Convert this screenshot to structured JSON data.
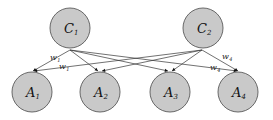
{
  "diagram": {
    "type": "bipartite-graph",
    "top_nodes": [
      {
        "id": "C1",
        "letter": "C",
        "sub": "1",
        "cx": 70,
        "cy": 28,
        "r": 20
      },
      {
        "id": "C2",
        "letter": "C",
        "sub": "2",
        "cx": 203,
        "cy": 28,
        "r": 20
      }
    ],
    "bottom_nodes": [
      {
        "id": "A1",
        "letter": "A",
        "sub": "1",
        "cx": 32,
        "cy": 92,
        "r": 20
      },
      {
        "id": "A2",
        "letter": "A",
        "sub": "2",
        "cx": 100,
        "cy": 92,
        "r": 20
      },
      {
        "id": "A3",
        "letter": "A",
        "sub": "3",
        "cx": 170,
        "cy": 92,
        "r": 20
      },
      {
        "id": "A4",
        "letter": "A",
        "sub": "4",
        "cx": 238,
        "cy": 92,
        "r": 20
      }
    ],
    "edges": [
      {
        "from": "C1",
        "to": "A1",
        "x1": 70,
        "y1": 50,
        "x2": 33,
        "y2": 71
      },
      {
        "from": "C1",
        "to": "A2",
        "x1": 70,
        "y1": 50,
        "x2": 98,
        "y2": 71
      },
      {
        "from": "C1",
        "to": "A3",
        "x1": 70,
        "y1": 50,
        "x2": 168,
        "y2": 71
      },
      {
        "from": "C1",
        "to": "A4",
        "x1": 70,
        "y1": 50,
        "x2": 237,
        "y2": 71
      },
      {
        "from": "C2",
        "to": "A1",
        "x1": 202,
        "y1": 50,
        "x2": 34,
        "y2": 71
      },
      {
        "from": "C2",
        "to": "A2",
        "x1": 202,
        "y1": 50,
        "x2": 102,
        "y2": 71
      },
      {
        "from": "C2",
        "to": "A3",
        "x1": 202,
        "y1": 50,
        "x2": 172,
        "y2": 71
      },
      {
        "from": "C2",
        "to": "A4",
        "x1": 202,
        "y1": 50,
        "x2": 238,
        "y2": 71
      }
    ],
    "weight_labels": [
      {
        "letter": "w",
        "sub": "1",
        "x": 50,
        "y": 60
      },
      {
        "letter": "w",
        "sub": "1",
        "x": 59,
        "y": 69
      },
      {
        "letter": "w",
        "sub": "4",
        "x": 222,
        "y": 59
      },
      {
        "letter": "w",
        "sub": "4",
        "x": 210,
        "y": 70
      }
    ],
    "colors": {
      "node_fill": "#c9c9c9",
      "node_stroke": "#5a5a5a",
      "edge": "#333333"
    }
  }
}
